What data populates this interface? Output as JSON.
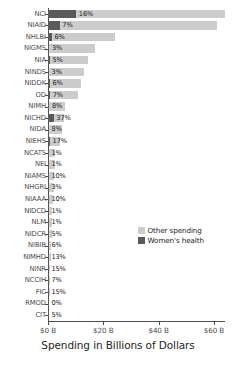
{
  "chart_data": {
    "type": "bar",
    "orientation": "horizontal",
    "stacked": true,
    "title": "",
    "xlabel": "Spending in Billions of Dollars",
    "ylabel": "",
    "xlim": [
      0,
      64
    ],
    "xticks": [
      0,
      20,
      40,
      60
    ],
    "xtick_labels": [
      "$0 B",
      "$20 B",
      "$40 B",
      "$60 B"
    ],
    "grid": false,
    "legend_position": "right-middle",
    "categories": [
      "NCI",
      "NIAID",
      "NHLBI",
      "NIGMS",
      "NIA",
      "NINDS",
      "NIDDK",
      "OD",
      "NIMH",
      "NICHD",
      "NIDA",
      "NIEHS",
      "NCATS",
      "NEI",
      "NIAMS",
      "NHGRI",
      "NIAAA",
      "NIDCD",
      "NLM",
      "NIDCR",
      "NIBIB",
      "NIMHD",
      "NINR",
      "NCCIH",
      "FIC",
      "RMOD",
      "CIT"
    ],
    "series": [
      {
        "name": "Other spending",
        "color": "#cccccc",
        "values": [
          64.0,
          61.0,
          24.2,
          17.0,
          14.5,
          13.0,
          11.8,
          11.0,
          6.2,
          5.7,
          5.0,
          4.4,
          2.6,
          2.4,
          2.1,
          2.0,
          1.9,
          1.5,
          1.4,
          1.3,
          1.2,
          1.1,
          0.9,
          0.8,
          0.6,
          0.45,
          0.4
        ]
      },
      {
        "name": "Women's health",
        "color": "#5a5a5a",
        "values": [
          10.24,
          4.27,
          1.45,
          0.51,
          0.73,
          0.39,
          0.71,
          0.77,
          0.5,
          2.11,
          0.4,
          0.75,
          0.03,
          0.02,
          0.21,
          0.06,
          0.19,
          0.02,
          0.01,
          0.07,
          0.07,
          0.14,
          0.14,
          0.06,
          0.09,
          0.0,
          0.02
        ]
      }
    ],
    "percent_labels": [
      "16%",
      "7%",
      "6%",
      "3%",
      "5%",
      "3%",
      "6%",
      "7%",
      "8%",
      "37%",
      "8%",
      "17%",
      "1%",
      "1%",
      "10%",
      "3%",
      "10%",
      "1%",
      "1%",
      "5%",
      "6%",
      "13%",
      "15%",
      "7%",
      "15%",
      "0%",
      "5%"
    ],
    "legend": [
      {
        "label": "Other spending",
        "color": "#cccccc"
      },
      {
        "label": "Women's health",
        "color": "#5a5a5a"
      }
    ]
  }
}
